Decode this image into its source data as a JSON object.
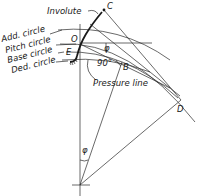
{
  "figure": {
    "labels": {
      "involute": "Involute",
      "add_circle": "Add. circle",
      "pitch_circle": "Pitch circle",
      "base_circle": "Base circle",
      "ded_circle": "Ded. circle",
      "pressure_line": "Pressure line",
      "right_angle": "90°",
      "phi_top": "φ",
      "phi_bottom": "φ"
    },
    "points": {
      "C": "C",
      "O": "O",
      "E": "E",
      "B": "B",
      "D": "D"
    }
  }
}
